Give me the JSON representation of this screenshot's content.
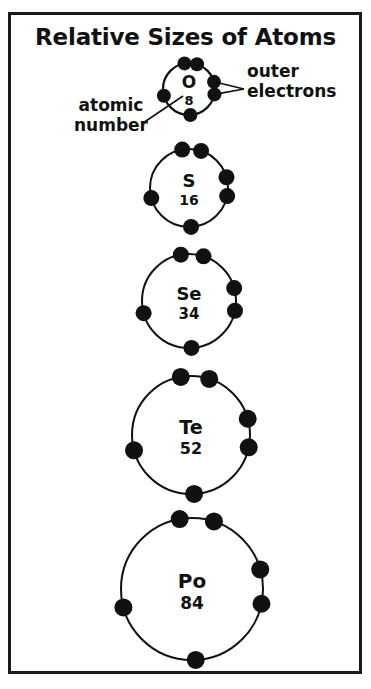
{
  "figure": {
    "title": "Relative Sizes of Atoms",
    "frame_color": "#1a1a1a",
    "background_color": "#ffffff",
    "ink_color": "#111111"
  },
  "annotations": {
    "atomic_number": {
      "line1": "atomic",
      "line2": "number",
      "points_to": "8"
    },
    "outer_electrons": {
      "line1": "outer",
      "line2": "electrons",
      "points_to": "right-electron-pair"
    }
  },
  "chart_data": {
    "type": "diagram",
    "title": "Relative Sizes of Atoms",
    "outer_electron_count": 6,
    "atoms": [
      {
        "symbol": "O",
        "atomic_number": "8",
        "radius_px": 26,
        "center_x": 189,
        "center_y": 89,
        "symbol_font_px": 17,
        "number_font_px": 13
      },
      {
        "symbol": "S",
        "atomic_number": "16",
        "radius_px": 39,
        "center_x": 189,
        "center_y": 188,
        "symbol_font_px": 18,
        "number_font_px": 14
      },
      {
        "symbol": "Se",
        "atomic_number": "34",
        "radius_px": 47,
        "center_x": 189,
        "center_y": 301,
        "symbol_font_px": 18,
        "number_font_px": 15
      },
      {
        "symbol": "Te",
        "atomic_number": "52",
        "radius_px": 59,
        "center_x": 191,
        "center_y": 435,
        "symbol_font_px": 19,
        "number_font_px": 16
      },
      {
        "symbol": "Po",
        "atomic_number": "84",
        "radius_px": 71,
        "center_x": 192,
        "center_y": 589,
        "symbol_font_px": 20,
        "number_font_px": 17
      }
    ],
    "electron_angles_deg": [
      -100,
      -72,
      165,
      12,
      -16,
      87
    ],
    "electron_dot_radius_px": [
      7,
      8,
      8,
      9,
      9
    ]
  }
}
